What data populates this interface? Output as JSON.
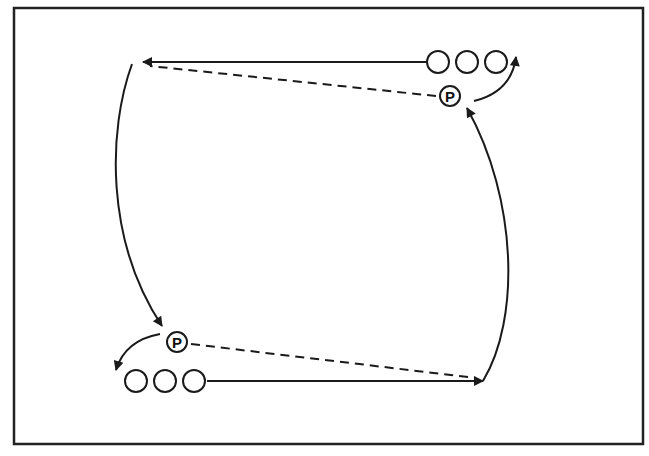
{
  "diagram": {
    "type": "drill-diagram",
    "colors": {
      "line": "#1a1a1a",
      "background": "#ffffff",
      "border": "#222222"
    },
    "passer_label": "P",
    "groups": [
      {
        "name": "top-right-line",
        "player_count": 3
      },
      {
        "name": "bottom-left-line",
        "player_count": 3
      }
    ],
    "passers": [
      {
        "name": "top-passer",
        "label": "P"
      },
      {
        "name": "bottom-passer",
        "label": "P"
      }
    ],
    "paths": [
      {
        "name": "top-run",
        "style": "solid",
        "from": "top-right-line",
        "to": "top-left-corner"
      },
      {
        "name": "top-pass",
        "style": "dashed",
        "from": "top-passer",
        "to": "top-left-corner"
      },
      {
        "name": "left-curve-run",
        "style": "solid-curve",
        "from": "top-left-corner",
        "to": "bottom-passer"
      },
      {
        "name": "bottom-passer-rotate",
        "style": "solid-curve",
        "from": "bottom-passer",
        "to": "bottom-left-line"
      },
      {
        "name": "bottom-run",
        "style": "solid",
        "from": "bottom-left-line",
        "to": "bottom-right-corner"
      },
      {
        "name": "bottom-pass",
        "style": "dashed",
        "from": "bottom-passer",
        "to": "bottom-right-corner"
      },
      {
        "name": "right-curve-run",
        "style": "solid-curve",
        "from": "bottom-right-corner",
        "to": "top-passer"
      },
      {
        "name": "top-passer-rotate",
        "style": "solid-curve",
        "from": "top-passer",
        "to": "top-right-line"
      }
    ]
  }
}
